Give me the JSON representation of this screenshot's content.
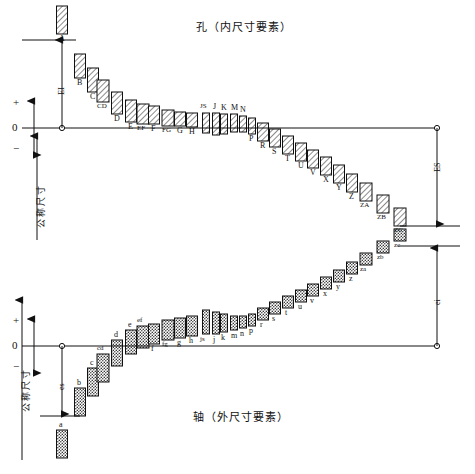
{
  "figure": {
    "title_hole": "孔（内尺寸要素）",
    "title_shaft": "轴（外尺寸要素）",
    "axis": {
      "zero": "0",
      "plus": "+",
      "minus": "−",
      "nominal_hole": "公称尺寸",
      "nominal_shaft": "公称尺寸"
    },
    "dims": {
      "EI": "EI",
      "ES": "ES",
      "es": "es",
      "ei": "ei"
    }
  },
  "chart_data": {
    "type": "bar",
    "xlabel": "",
    "ylabel": "Deviation from nominal size",
    "grid": false,
    "legend": "none",
    "panels": [
      {
        "name": "hole",
        "title": "孔（内尺寸要素）",
        "case": "uppercase",
        "fill": "hatched",
        "lower_deviation_label": "EI",
        "upper_deviation_label": "ES",
        "categories": [
          "A",
          "B",
          "C",
          "CD",
          "D",
          "E",
          "EF",
          "F",
          "FG",
          "G",
          "H",
          "JS",
          "J",
          "K",
          "M",
          "N",
          "P",
          "R",
          "S",
          "T",
          "U",
          "V",
          "X",
          "Y",
          "Z",
          "ZA",
          "ZB",
          "ZC"
        ],
        "x": [
          62,
          80,
          93,
          103,
          117,
          131,
          143,
          154,
          168,
          180,
          192,
          206,
          216,
          224,
          234,
          243,
          252,
          263,
          275,
          288,
          301,
          313,
          326,
          339,
          352,
          366,
          383,
          400
        ],
        "box_top": [
          6,
          54,
          68,
          80,
          92,
          100,
          104,
          106,
          110,
          112,
          113,
          113,
          113,
          114,
          114,
          116,
          118,
          123,
          129,
          136,
          143,
          150,
          157,
          165,
          174,
          183,
          195,
          208
        ],
        "box_bottom": [
          34,
          78,
          92,
          102,
          114,
          122,
          124,
          124,
          126,
          126,
          127,
          133,
          135,
          134,
          132,
          132,
          134,
          141,
          147,
          154,
          161,
          168,
          175,
          183,
          192,
          201,
          213,
          226
        ],
        "values_note": "box_top/box_bottom are pixel y-coordinates; zero line at y=128"
      },
      {
        "name": "shaft",
        "title": "轴（外尺寸要素）",
        "case": "lowercase",
        "fill": "stippled",
        "upper_deviation_label": "es",
        "lower_deviation_label": "ei",
        "categories": [
          "a",
          "b",
          "c",
          "cd",
          "d",
          "e",
          "ef",
          "f",
          "fg",
          "g",
          "h",
          "js",
          "j",
          "k",
          "m",
          "n",
          "p",
          "r",
          "s",
          "t",
          "u",
          "v",
          "x",
          "y",
          "z",
          "za",
          "zb",
          "zc"
        ],
        "x": [
          62,
          80,
          93,
          103,
          117,
          131,
          143,
          154,
          168,
          180,
          192,
          206,
          216,
          224,
          234,
          243,
          252,
          263,
          275,
          288,
          301,
          313,
          326,
          339,
          352,
          366,
          383,
          400
        ],
        "box_top": [
          430,
          388,
          368,
          354,
          340,
          330,
          326,
          324,
          320,
          318,
          316,
          310,
          312,
          314,
          316,
          316,
          314,
          308,
          302,
          296,
          290,
          284,
          277,
          270,
          262,
          253,
          241,
          229
        ],
        "box_bottom": [
          458,
          416,
          396,
          382,
          366,
          354,
          348,
          344,
          340,
          338,
          336,
          334,
          334,
          332,
          330,
          328,
          326,
          320,
          314,
          308,
          302,
          296,
          289,
          282,
          274,
          265,
          253,
          241
        ],
        "values_note": "box_top/box_bottom are pixel y-coordinates; zero line at y=346"
      }
    ],
    "annotations": [
      {
        "text": "EI",
        "panel": "hole",
        "meaning": "lower deviation of hole, measured upward from zero line"
      },
      {
        "text": "ES",
        "panel": "hole",
        "meaning": "upper deviation of hole, measured downward from zero line"
      },
      {
        "text": "es",
        "panel": "shaft",
        "meaning": "upper deviation of shaft, measured downward from zero line"
      },
      {
        "text": "ei",
        "panel": "shaft",
        "meaning": "lower deviation of shaft, measured upward from zero line"
      }
    ]
  }
}
